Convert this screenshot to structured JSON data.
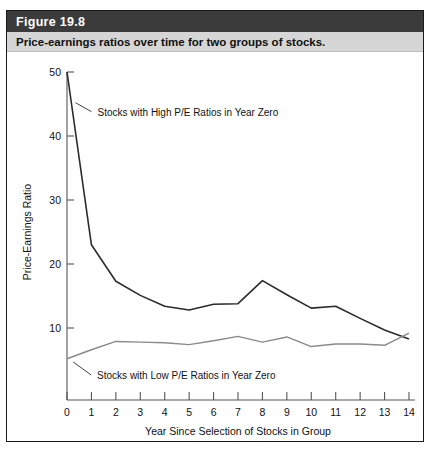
{
  "figure": {
    "number_label": "Figure 19.8",
    "caption": "Price-earnings ratios over time for two groups of stocks."
  },
  "colors": {
    "header_bar": "#3b3b3b",
    "caption_bar": "#d6d6d6",
    "border": "#1a1a1a",
    "series_high": "#2b2b2b",
    "series_low": "#8a8a8a",
    "axis": "#555555"
  },
  "chart_data": {
    "type": "line",
    "title": "Price-earnings ratios over time for two groups of stocks.",
    "xlabel": "Year Since Selection of Stocks in Group",
    "ylabel": "Price-Earnings Ratio",
    "xlim": [
      0,
      14
    ],
    "ylim": [
      0,
      50
    ],
    "grid": false,
    "legend_position": "inline-annotations",
    "x": [
      0,
      1,
      2,
      3,
      4,
      5,
      6,
      7,
      8,
      9,
      10,
      11,
      12,
      13,
      14
    ],
    "xticks": [
      "0",
      "1",
      "2",
      "3",
      "4",
      "5",
      "6",
      "7",
      "8",
      "9",
      "10",
      "11",
      "12",
      "13",
      "14"
    ],
    "yticks": [
      "10",
      "20",
      "30",
      "40",
      "50"
    ],
    "ytick_values": [
      10,
      20,
      30,
      40,
      50
    ],
    "series": [
      {
        "name": "Stocks with High P/E Ratios in Year Zero",
        "color": "#2b2b2b",
        "values": [
          50.0,
          23.0,
          17.3,
          15.1,
          13.4,
          12.8,
          13.7,
          13.8,
          17.4,
          15.2,
          13.1,
          13.4,
          11.5,
          9.7,
          8.3
        ]
      },
      {
        "name": "Stocks with Low P/E Ratios in Year Zero",
        "color": "#8a8a8a",
        "values": [
          5.2,
          6.6,
          7.9,
          7.8,
          7.7,
          7.4,
          8.0,
          8.7,
          7.8,
          8.6,
          7.1,
          7.5,
          7.5,
          7.3,
          9.2
        ]
      }
    ],
    "annotations": [
      {
        "text": "Stocks with High P/E Ratios in Year Zero",
        "anchor_year": 0.35,
        "anchor_value": 45.2
      },
      {
        "text": "Stocks with Low P/E Ratios in Year Zero",
        "anchor_year": 0.25,
        "anchor_value": 4.7
      }
    ]
  }
}
